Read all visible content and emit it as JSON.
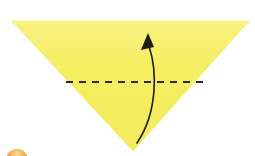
{
  "figure": {
    "kind": "origami-fold-diagram",
    "background_color": "#ffffff",
    "width": 255,
    "height": 156
  },
  "paper": {
    "name": "folded-paper-triangle",
    "shape": "triangle",
    "orientation": "point-down",
    "fill_color": "#f5ee63",
    "edge_shadow_color": "#e9dd4e",
    "vertices": [
      {
        "label": "top-left",
        "x": 12,
        "y": 21
      },
      {
        "label": "top-right",
        "x": 249,
        "y": 21
      },
      {
        "label": "bottom-apex",
        "x": 133,
        "y": 151
      }
    ]
  },
  "fold_line": {
    "name": "valley-fold-dashed-line",
    "style": "dashed",
    "color": "#2b2b22",
    "stroke_width": 2.2,
    "dash_pattern": "7 6",
    "start": {
      "x": 66,
      "y": 82
    },
    "end": {
      "x": 205,
      "y": 82
    }
  },
  "fold_arrow": {
    "name": "fold-direction-arrow",
    "color": "#1d1d14",
    "stroke_width": 1.6,
    "direction": "upward",
    "tail": {
      "x": 137,
      "y": 143
    },
    "control_one": {
      "x": 158,
      "y": 112
    },
    "control_two": {
      "x": 157,
      "y": 70
    },
    "head_tip": {
      "x": 148,
      "y": 33
    },
    "head_width": 13,
    "head_length": 17
  },
  "step_badge": {
    "name": "step-number-badge",
    "visible_portion": "top-sliver",
    "fill_color": "#f0a93c",
    "highlight_color": "#f7d79b",
    "center": {
      "x": 17,
      "y": 160
    },
    "radius": 11,
    "label": ""
  },
  "labels": {
    "alt_text": "A yellow triangle of folded paper pointing downward with a horizontal dashed fold line across its middle and a curved black arrow pointing upward, indicating the bottom point folds up.",
    "caption": ""
  }
}
